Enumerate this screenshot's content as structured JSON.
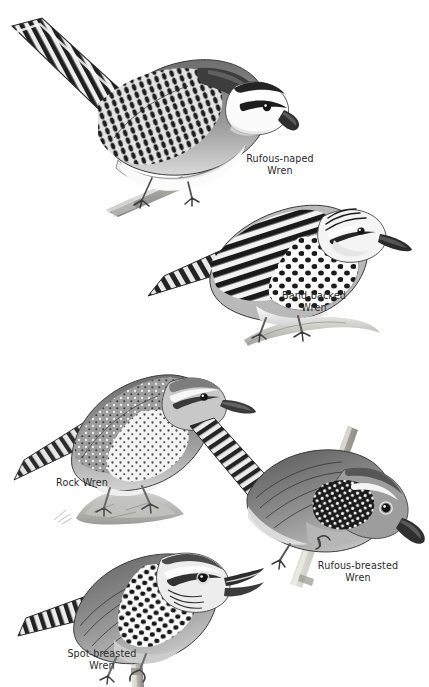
{
  "plate": {
    "kind": "field-guide-illustration-plate",
    "background_color": "#ffffff",
    "ink_color": "#2b2b2b",
    "width": 429,
    "height": 687
  },
  "species": [
    {
      "id": "rufous-naped",
      "name_line1": "Rufous-naped",
      "name_line2": "Wren",
      "pose": "perched on diagonal branch, facing right, tail raised to upper-left",
      "markings": "bold white supercilium, black eyeline, heavily barred black-and-white back and tail, plain white underparts"
    },
    {
      "id": "band-backed",
      "name_line1": "Band-backed",
      "name_line2": "Wren",
      "pose": "perched on pale branch, facing right",
      "markings": "strongly banded black-and-white back, streaked crown, spotted breast and flanks"
    },
    {
      "id": "rock",
      "name_line1": "Rock Wren",
      "name_line2": "",
      "pose": "standing on a low rock, facing right",
      "markings": "grey finely speckled upperparts, pale speckled underparts, barred tail"
    },
    {
      "id": "rufous-breasted",
      "name_line1": "Rufous-breasted",
      "name_line2": "Wren",
      "pose": "clinging to a diagonal stem, head lowered, facing lower-right",
      "markings": "plain warm back, black-and-white checkered cheek patch, barred tail"
    },
    {
      "id": "spot-breasted",
      "name_line1": "Spot-breasted",
      "name_line2": "Wren",
      "pose": "perched on upright stem, bill open singing, facing right",
      "markings": "boldly black-spotted white throat and breast, streaked face, barred tail"
    }
  ]
}
